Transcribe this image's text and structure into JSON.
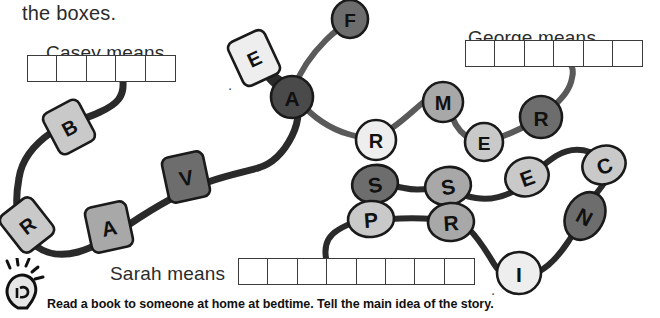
{
  "worksheet": {
    "prompt_text": "the boxes.",
    "footer_instruction": "Read a book to someone at home at bedtime. Tell the main idea of the story.",
    "lightbulb_icon": "lightbulb-icon"
  },
  "answer_rows": [
    {
      "id": "casey",
      "label": "Casey means",
      "label_x": 46,
      "label_y": 42,
      "boxes_x": 27,
      "boxes_y": 55,
      "cell_w": 31,
      "cell_h": 27,
      "cell_count": 5,
      "trailing_period": ".",
      "period_x": 228,
      "period_y": 76
    },
    {
      "id": "george",
      "label": "George means",
      "label_x": 468,
      "label_y": 27,
      "boxes_x": 465,
      "boxes_y": 40,
      "cell_w": 31,
      "cell_h": 27,
      "cell_count": 6,
      "trailing_period": "",
      "period_x": 0,
      "period_y": 0
    },
    {
      "id": "sarah",
      "label": "Sarah means",
      "label_x": 110,
      "label_y": 263,
      "boxes_x": 238,
      "boxes_y": 258,
      "cell_w": 31,
      "cell_h": 27,
      "cell_count": 8,
      "trailing_period": ".",
      "period_x": 491,
      "period_y": 281
    }
  ],
  "colors": {
    "bead_light": "#eeeeee",
    "bead_mid_light": "#c9c9c9",
    "bead_mid": "#a8a8a8",
    "bead_dark": "#6d6d6d",
    "bead_darkest": "#4a4a4a",
    "outline": "#1a1a1a",
    "string_dark": "#2a2a2a",
    "string_grey": "#5a5a5a",
    "box_border": "#3b3b3b",
    "text": "#2b2b2b"
  },
  "strings": [
    {
      "name": "casey-string",
      "d": "M123,82 C124,96 118,104 100,112 C82,121 66,122 52,132 C36,143 22,158 19,178 C15,200 16,222 26,236 C38,252 56,258 78,252 C100,246 120,230 142,216 C164,202 186,190 208,182 C228,175 244,172 258,168",
      "color": "string_dark",
      "width": 7
    },
    {
      "name": "casey-string-upper",
      "d": "M258,168 C272,164 284,152 292,136 C300,120 300,104 292,92 C284,80 272,74 262,70",
      "color": "string_dark",
      "width": 7
    },
    {
      "name": "e-to-a-string",
      "d": "M262,70 C268,78 276,86 284,92",
      "color": "string_dark",
      "width": 7
    },
    {
      "name": "a-to-f-string",
      "d": "M294,88 C300,72 312,54 326,40 C334,32 342,26 350,22",
      "color": "string_grey",
      "width": 6
    },
    {
      "name": "a-to-r-string",
      "d": "M300,102 C312,116 328,128 348,134 C358,137 366,138 372,139",
      "color": "string_grey",
      "width": 6
    },
    {
      "name": "r-to-m-string",
      "d": "M392,128 C404,120 416,108 426,100 C432,95 436,93 440,92",
      "color": "string_grey",
      "width": 6
    },
    {
      "name": "m-to-e-string",
      "d": "M450,108 C452,120 458,130 466,136 C470,139 474,141 478,142",
      "color": "string_grey",
      "width": 6
    },
    {
      "name": "e-to-r2-string",
      "d": "M498,138 C510,134 522,128 534,122",
      "color": "string_grey",
      "width": 6
    },
    {
      "name": "r2-to-box-string",
      "d": "M554,106 C562,98 570,90 572,78 C574,70 572,66 570,64",
      "color": "string_grey",
      "width": 6
    },
    {
      "name": "sarah-string-start",
      "d": "M326,258 C324,246 328,236 338,230 C346,225 354,222 360,220",
      "color": "string_dark",
      "width": 6
    },
    {
      "name": "p-to-r3-string",
      "d": "M390,219 C404,218 420,218 434,219",
      "color": "string_dark",
      "width": 6
    },
    {
      "name": "r3-to-i-string",
      "d": "M468,228 C480,240 488,254 494,264 C498,270 502,274 506,276",
      "color": "string_dark",
      "width": 6
    },
    {
      "name": "i-to-n-string",
      "d": "M538,272 C550,266 560,254 568,242 C572,236 574,232 576,230",
      "color": "string_dark",
      "width": 6
    },
    {
      "name": "n-to-c-string",
      "d": "M596,194 C604,184 610,176 614,166 C617,159 617,155 616,152",
      "color": "string_dark",
      "width": 6
    },
    {
      "name": "c-to-e2-string",
      "d": "M590,152 C578,148 566,150 556,156 C550,160 546,163 544,165",
      "color": "string_dark",
      "width": 6
    },
    {
      "name": "e2-to-s2-string",
      "d": "M512,192 C500,198 488,200 476,198 C470,197 466,196 464,195",
      "color": "string_dark",
      "width": 6
    },
    {
      "name": "s2-to-s1-string",
      "d": "M432,188 C422,190 412,190 404,188 C398,187 394,186 392,185",
      "color": "string_dark",
      "width": 6
    }
  ],
  "beads": [
    {
      "letter": "E",
      "shape": "barrel",
      "cx": 254,
      "cy": 58,
      "rx": 20,
      "ry": 24,
      "rot": -25,
      "fill": "bead_light",
      "font": 20,
      "name": "bead-e-casey"
    },
    {
      "letter": "B",
      "shape": "barrel",
      "cx": 69,
      "cy": 127,
      "rx": 20,
      "ry": 23,
      "rot": -28,
      "fill": "bead_mid_light",
      "font": 20,
      "name": "bead-b-casey"
    },
    {
      "letter": "R",
      "shape": "barrel",
      "cx": 27,
      "cy": 225,
      "rx": 20,
      "ry": 23,
      "rot": -38,
      "fill": "bead_mid_light",
      "font": 20,
      "name": "bead-r-casey"
    },
    {
      "letter": "A",
      "shape": "barrel",
      "cx": 109,
      "cy": 227,
      "rx": 21,
      "ry": 23,
      "rot": -12,
      "fill": "bead_mid",
      "font": 21,
      "name": "bead-a-casey"
    },
    {
      "letter": "V",
      "shape": "barrel",
      "cx": 186,
      "cy": 177,
      "rx": 21,
      "ry": 23,
      "rot": -12,
      "fill": "bead_dark",
      "font": 21,
      "name": "bead-v-casey"
    },
    {
      "letter": "A",
      "shape": "circle",
      "cx": 292,
      "cy": 97,
      "rx": 21,
      "ry": 21,
      "rot": 0,
      "fill": "bead_darkest",
      "font": 21,
      "name": "bead-a-george"
    },
    {
      "letter": "F",
      "shape": "circle",
      "cx": 350,
      "cy": 19,
      "rx": 18,
      "ry": 19,
      "rot": 0,
      "fill": "bead_dark",
      "font": 19,
      "name": "bead-f-george"
    },
    {
      "letter": "R",
      "shape": "circle",
      "cx": 376,
      "cy": 140,
      "rx": 20,
      "ry": 20,
      "rot": 0,
      "fill": "bead_light",
      "font": 20,
      "name": "bead-r-george"
    },
    {
      "letter": "M",
      "shape": "circle",
      "cx": 443,
      "cy": 102,
      "rx": 20,
      "ry": 20,
      "rot": 0,
      "fill": "bead_mid",
      "font": 20,
      "name": "bead-m-george"
    },
    {
      "letter": "E",
      "shape": "circle",
      "cx": 484,
      "cy": 142,
      "rx": 19,
      "ry": 19,
      "rot": 0,
      "fill": "bead_mid_light",
      "font": 19,
      "name": "bead-e-george"
    },
    {
      "letter": "R",
      "shape": "circle",
      "cx": 541,
      "cy": 117,
      "rx": 21,
      "ry": 21,
      "rot": 0,
      "fill": "bead_dark",
      "font": 21,
      "name": "bead-r2-george"
    },
    {
      "letter": "C",
      "shape": "ellipse",
      "cx": 604,
      "cy": 165,
      "rx": 22,
      "ry": 19,
      "rot": -22,
      "fill": "bead_mid_light",
      "font": 21,
      "name": "bead-c-sarah"
    },
    {
      "letter": "E",
      "shape": "ellipse",
      "cx": 527,
      "cy": 177,
      "rx": 22,
      "ry": 19,
      "rot": -20,
      "fill": "bead_mid_light",
      "font": 21,
      "name": "bead-e2-sarah"
    },
    {
      "letter": "S",
      "shape": "ellipse",
      "cx": 448,
      "cy": 186,
      "rx": 23,
      "ry": 19,
      "rot": -10,
      "fill": "bead_mid",
      "font": 21,
      "name": "bead-s2-sarah"
    },
    {
      "letter": "S",
      "shape": "ellipse",
      "cx": 375,
      "cy": 184,
      "rx": 23,
      "ry": 19,
      "rot": -10,
      "fill": "bead_dark",
      "font": 21,
      "name": "bead-s1-sarah"
    },
    {
      "letter": "P",
      "shape": "ellipse",
      "cx": 371,
      "cy": 219,
      "rx": 23,
      "ry": 18,
      "rot": -4,
      "fill": "bead_mid_light",
      "font": 21,
      "name": "bead-p-sarah"
    },
    {
      "letter": "R",
      "shape": "ellipse",
      "cx": 451,
      "cy": 222,
      "rx": 23,
      "ry": 19,
      "rot": -4,
      "fill": "bead_mid",
      "font": 21,
      "name": "bead-r3-sarah"
    },
    {
      "letter": "N",
      "shape": "ellipse",
      "cx": 585,
      "cy": 216,
      "rx": 19,
      "ry": 25,
      "rot": 28,
      "fill": "bead_dark",
      "font": 21,
      "name": "bead-n-sarah"
    },
    {
      "letter": "I",
      "shape": "ellipse",
      "cx": 519,
      "cy": 273,
      "rx": 22,
      "ry": 21,
      "rot": 0,
      "fill": "bead_light",
      "font": 21,
      "name": "bead-i-sarah"
    }
  ]
}
